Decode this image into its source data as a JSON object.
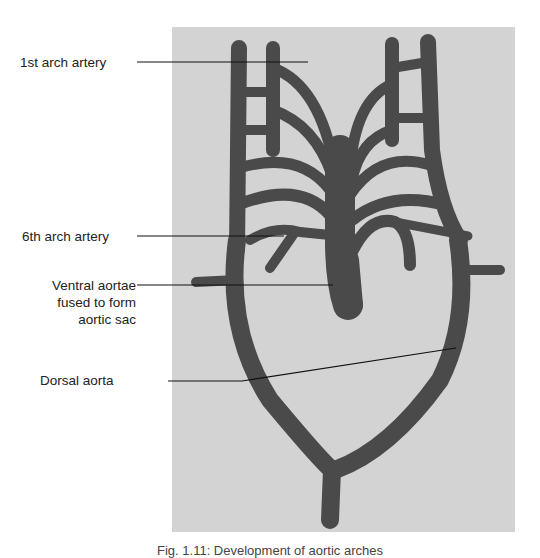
{
  "figure": {
    "labels": {
      "first_arch": "1st arch artery",
      "sixth_arch": "6th arch artery",
      "ventral_line1": "Ventral aortae",
      "ventral_line2": "fused to form",
      "ventral_line3": "aortic sac",
      "dorsal": "Dorsal aorta"
    },
    "caption": "Fig. 1.11: Development of aortic arches",
    "colors": {
      "background": "#d3d3d3",
      "vessel": "#4a4a4a",
      "leader_line": "#111111"
    }
  }
}
